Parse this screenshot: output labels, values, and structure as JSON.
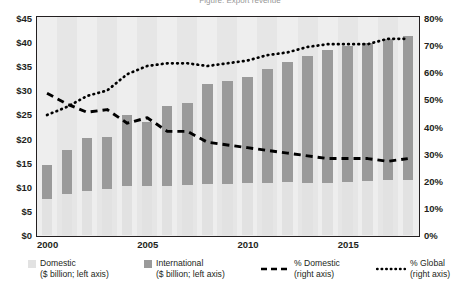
{
  "title": "Figure: Export revenue",
  "axes": {
    "left_ticks": [
      "$45",
      "$40",
      "$35",
      "$30",
      "$25",
      "$20",
      "$15",
      "$10",
      "$5",
      "$0"
    ],
    "right_ticks": [
      "80%",
      "70%",
      "60%",
      "50%",
      "40%",
      "30%",
      "20%",
      "10%",
      "0%"
    ],
    "x_ticks": [
      "2000",
      "2005",
      "2010",
      "2015"
    ]
  },
  "legend": {
    "items": [
      {
        "name": "domestic",
        "swatch": "square",
        "color": "#e2e2e2",
        "label": "Domestic",
        "sub": "($ billion; left axis)"
      },
      {
        "name": "international",
        "swatch": "square",
        "color": "#9a9a9a",
        "label": "International",
        "sub": "($ billion; left axis)"
      },
      {
        "name": "pct-domestic",
        "swatch": "dashed",
        "color": "#000000",
        "label": "% Domestic",
        "sub": "(right axis)"
      },
      {
        "name": "pct-global",
        "swatch": "dotted",
        "color": "#000000",
        "label": "% Global",
        "sub": "(right axis)"
      }
    ]
  },
  "chart_data": {
    "type": "bar",
    "title": "Figure: Export revenue",
    "xlabel": "",
    "ylabel": "$ billion",
    "y2label": "%",
    "ylim": [
      0,
      45
    ],
    "y2lim": [
      0,
      80
    ],
    "grid": false,
    "legend_position": "bottom",
    "categories": [
      "2000",
      "2001",
      "2002",
      "2003",
      "2004",
      "2005",
      "2006",
      "2007",
      "2008",
      "2009",
      "2010",
      "2011",
      "2012",
      "2013",
      "2014",
      "2015",
      "2016",
      "2017",
      "2018"
    ],
    "series": [
      {
        "name": "Domestic",
        "axis": "left",
        "type": "bar-stacked-bottom",
        "color": "#e2e2e2",
        "values": [
          7.4,
          8.4,
          9.1,
          9.4,
          10.1,
          10.0,
          10.1,
          10.2,
          10.4,
          10.4,
          10.6,
          10.8,
          10.9,
          10.8,
          10.8,
          11.0,
          11.2,
          11.3,
          11.4
        ]
      },
      {
        "name": "International",
        "axis": "left",
        "type": "bar-stacked-top",
        "color": "#9a9a9a",
        "values": [
          7.0,
          9.1,
          11.0,
          10.8,
          14.6,
          13.3,
          16.5,
          17.0,
          20.7,
          21.4,
          22.1,
          23.5,
          24.9,
          26.1,
          27.3,
          28.1,
          28.5,
          29.2,
          29.7
        ]
      },
      {
        "name": "Total",
        "axis": "left",
        "type": "bar-total",
        "values": [
          14.4,
          17.5,
          20.1,
          20.2,
          24.7,
          23.3,
          26.6,
          27.2,
          31.1,
          31.8,
          32.7,
          34.3,
          35.8,
          36.9,
          38.1,
          39.1,
          39.7,
          40.5,
          41.1
        ]
      },
      {
        "name": "% Domestic",
        "axis": "right",
        "type": "line-dashed",
        "color": "#000000",
        "values": [
          52,
          48,
          45,
          46,
          41,
          43,
          38,
          38,
          34,
          33,
          32,
          31,
          30,
          29,
          28,
          28,
          28,
          27,
          28
        ]
      },
      {
        "name": "% Global",
        "axis": "right",
        "type": "line-dotted",
        "color": "#000000",
        "values": [
          44,
          47,
          51,
          53,
          59,
          62,
          63,
          63,
          62,
          63,
          64,
          66,
          67,
          69,
          70,
          70,
          70,
          72,
          72
        ]
      }
    ]
  }
}
